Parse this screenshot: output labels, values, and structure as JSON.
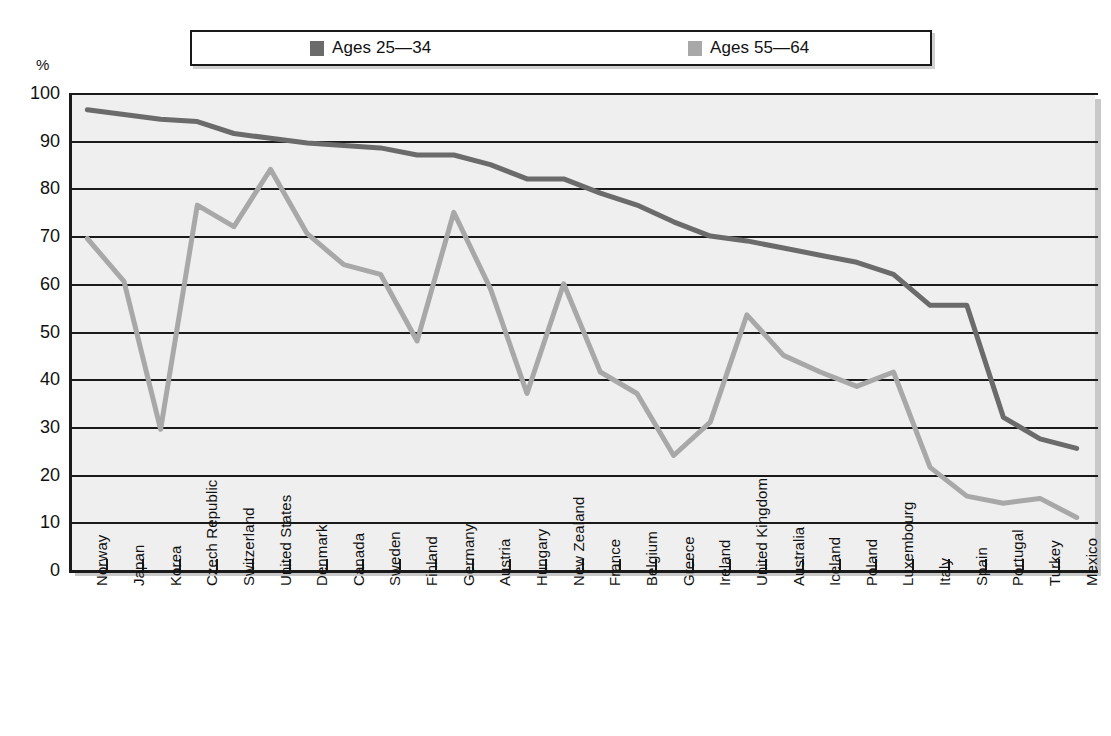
{
  "axis": {
    "y_unit": "%",
    "y_ticks": [
      0,
      10,
      20,
      30,
      40,
      50,
      60,
      70,
      80,
      90,
      100
    ]
  },
  "legend": {
    "items": [
      {
        "label": "Ages 25—34",
        "color": "#6b6b6b",
        "swatch_name": "legend-swatch-ages-25-34"
      },
      {
        "label": "Ages 55—64",
        "color": "#a8a8a8",
        "swatch_name": "legend-swatch-ages-55-64"
      }
    ]
  },
  "chart_data": {
    "type": "line",
    "title": "",
    "xlabel": "",
    "ylabel": "%",
    "ylim": [
      0,
      100
    ],
    "grid": true,
    "legend_position": "top",
    "categories": [
      "Norway",
      "Japan",
      "Korea",
      "Czech Republic",
      "Switzerland",
      "United States",
      "Denmark",
      "Canada",
      "Sweden",
      "Finland",
      "Germany",
      "Austria",
      "Hungary",
      "New Zealand",
      "France",
      "Belgium",
      "Greece",
      "Ireland",
      "United Kingdom",
      "Australia",
      "Iceland",
      "Poland",
      "Luxembourg",
      "Italy",
      "Spain",
      "Portugal",
      "Turkey",
      "Mexico"
    ],
    "series": [
      {
        "name": "Ages 25—34",
        "color": "#6b6b6b",
        "values": [
          96.5,
          95.5,
          94.5,
          94.0,
          91.5,
          90.5,
          89.5,
          89.0,
          88.5,
          87.0,
          87.0,
          85.0,
          82.0,
          82.0,
          79.0,
          76.5,
          73.0,
          70.0,
          69.0,
          67.5,
          66.0,
          64.5,
          62.0,
          55.5,
          55.5,
          32.0,
          27.5,
          25.5
        ]
      },
      {
        "name": "Ages 55—64",
        "color": "#a8a8a8",
        "values": [
          69.5,
          60.5,
          29.5,
          76.5,
          72.0,
          84.0,
          70.5,
          64.0,
          62.0,
          48.0,
          75.0,
          59.0,
          37.0,
          60.0,
          41.5,
          37.0,
          24.0,
          31.0,
          53.5,
          45.0,
          41.5,
          38.5,
          41.5,
          21.5,
          15.5,
          14.0,
          15.0,
          11.0
        ]
      }
    ]
  }
}
